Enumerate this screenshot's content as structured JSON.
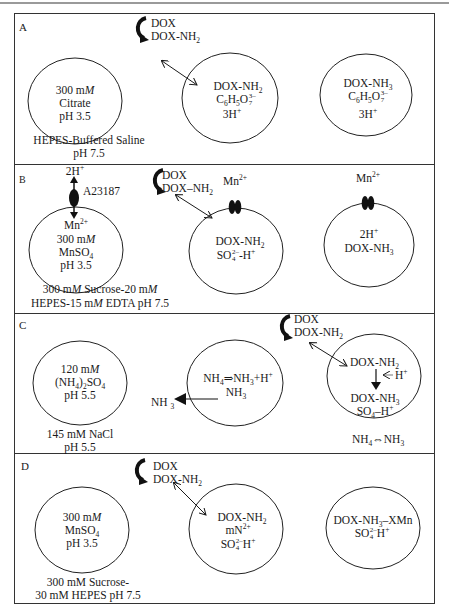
{
  "figure": {
    "panels": [
      {
        "label": "A",
        "flip_text": [
          "DOX",
          "DOX-NH2"
        ],
        "circles": [
          {
            "lines": [
              "300 mM",
              "Citrate",
              "pH 3.5"
            ]
          },
          {
            "lines": [
              "DOX-NH2",
              "C6H5O7 3−",
              "3H+"
            ]
          },
          {
            "lines": [
              "DOX-NH3",
              "C6H5O7 3−",
              "3H+"
            ]
          }
        ],
        "buffer": [
          "HEPES-Buffered Saline",
          "pH 7.5"
        ]
      },
      {
        "label": "B",
        "ionophore": {
          "name": "A23187",
          "out": "2H+",
          "in": "Mn2+"
        },
        "flip_text": [
          "DOX",
          "DOX–NH2"
        ],
        "channel_label": "Mn2+",
        "circles": [
          {
            "lines": [
              "Mn2+",
              "300 mM",
              "MnSO4",
              "pH 3.5"
            ]
          },
          {
            "lines": [
              "DOX-NH2",
              "SO4 2−-H+"
            ]
          },
          {
            "lines": [
              "2H+",
              "DOX-NH3"
            ]
          }
        ],
        "buffer": [
          "300 mM Sucrose-20 mM",
          "HEPES-15 mM EDTA pH 7.5"
        ]
      },
      {
        "label": "C",
        "flip_text": [
          "DOX",
          "DOX-NH2"
        ],
        "circles": [
          {
            "lines": [
              "120 mM",
              "(NH4)2SO4",
              "pH 5.5"
            ]
          },
          {
            "lines": [
              "NH4⇒NH3+H+",
              "NH3"
            ]
          },
          {
            "lines": [
              "DOX-NH2",
              "H+",
              "DOX-NH3",
              "SO4–H+"
            ]
          }
        ],
        "efflux_label": "NH3",
        "buffer": [
          "145 mM NaCl",
          "pH 5.5"
        ],
        "equilibrium": "NH4⇔NH3"
      },
      {
        "label": "D",
        "flip_text": [
          "DOX",
          "DOX-NH2"
        ],
        "circles": [
          {
            "lines": [
              "300 mM",
              "MnSO4",
              "pH 3.5"
            ]
          },
          {
            "lines": [
              "DOX-NH2",
              "mN2+",
              "SO4 2−H+"
            ]
          },
          {
            "lines": [
              "DOX-NH3–XMn",
              "SO4 2−H+"
            ]
          }
        ],
        "buffer": [
          "300 mM Sucrose-",
          "30 mM HEPES pH 7.5"
        ]
      }
    ]
  }
}
